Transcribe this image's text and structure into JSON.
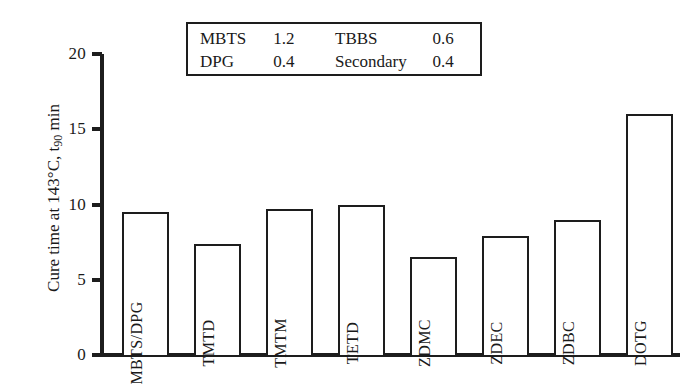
{
  "chart_data": {
    "type": "bar",
    "title": "",
    "xlabel": "",
    "ylabel": "Cure time at 143°C, t90 min",
    "ylabel_prefix": "Cure time at 143°C, t",
    "ylabel_sub": "90",
    "ylabel_suffix": " min",
    "ylim": [
      0,
      20
    ],
    "yticks": [
      "0",
      "5",
      "10",
      "15",
      "20"
    ],
    "ytick_values": [
      0,
      5,
      10,
      15,
      20
    ],
    "grid": false,
    "legend_position": "top-center",
    "bar_fill": "#ffffff",
    "bar_edge": "#1d1d1d",
    "categories": [
      "MBTS/DPG",
      "TMTD",
      "TMTM",
      "TETD",
      "ZDMC",
      "ZDEC",
      "ZDBC",
      "DOTG"
    ],
    "values": [
      9.5,
      7.4,
      9.7,
      10.0,
      6.5,
      7.9,
      9.0,
      16.0
    ]
  },
  "legend": {
    "rows": [
      {
        "name1": "MBTS",
        "value1": "1.2",
        "name2": "TBBS",
        "value2": "0.6"
      },
      {
        "name1": "DPG",
        "value1": "0.4",
        "name2": "Secondary",
        "value2": "0.4"
      }
    ]
  }
}
